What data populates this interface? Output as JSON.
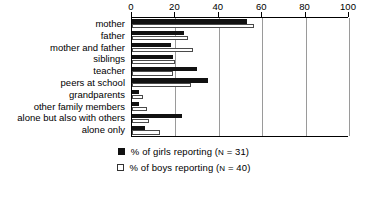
{
  "chart_data": {
    "type": "bar",
    "orientation": "horizontal",
    "title": "",
    "xlabel": "",
    "ylabel": "",
    "xlim": [
      0,
      100
    ],
    "xticks": [
      0,
      20,
      40,
      60,
      80,
      100
    ],
    "grid": true,
    "legend_position": "bottom-center",
    "categories": [
      "mother",
      "father",
      "mother and father",
      "siblings",
      "teacher",
      "peers at school",
      "grandparents",
      "other family members",
      "alone but also with others",
      "alone only"
    ],
    "series": [
      {
        "name": "% of girls reporting (N = 31)",
        "key": "girls",
        "color": "#111111",
        "style": "filled",
        "values": [
          53,
          24,
          18,
          19,
          30,
          35,
          3,
          3,
          23,
          6
        ]
      },
      {
        "name": "% of boys reporting (N = 40)",
        "key": "boys",
        "color": "#ffffff",
        "style": "hollow",
        "values": [
          56,
          26,
          28,
          20,
          19,
          27,
          5,
          7,
          8,
          13
        ]
      }
    ]
  },
  "legend": {
    "items": [
      {
        "label": "% of girls reporting (N = 31)",
        "swatch": "filled-square"
      },
      {
        "label": "% of boys reporting (N = 40)",
        "swatch": "hollow-square"
      }
    ]
  },
  "caption": ""
}
